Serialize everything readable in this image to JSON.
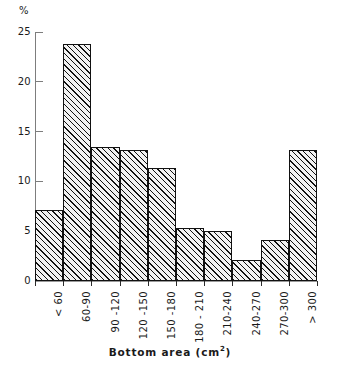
{
  "chart_data": {
    "type": "bar",
    "title": "",
    "subtitle": "",
    "xlabel": "Bottom area (cm²)",
    "ylabel": "%",
    "categories": [
      "< 60",
      "60-90",
      "90 -120",
      "120 -150",
      "150 -180",
      "180 - 210",
      "210-240",
      "240-270",
      "270-300",
      "> 300"
    ],
    "values": [
      7.1,
      23.8,
      13.5,
      13.2,
      11.3,
      5.3,
      5.0,
      2.1,
      4.1,
      13.2
    ],
    "ylim": [
      0,
      25
    ],
    "yticks": [
      0,
      5,
      10,
      15,
      20,
      25
    ],
    "ytick_labels": [
      "0",
      "5",
      "10",
      "15",
      "20",
      "25"
    ],
    "grid": false,
    "legend": null,
    "bar_fill": "#f2f2f2",
    "bar_hatch": "diagonal-45",
    "bar_edge_color": "#111111",
    "axis_color": "#7d7d7d",
    "background": "#ffffff"
  },
  "axis": {
    "y_unit_label": "%",
    "x_title_main": "Bottom area (cm",
    "x_title_sup": "2",
    "x_title_close": ")"
  }
}
